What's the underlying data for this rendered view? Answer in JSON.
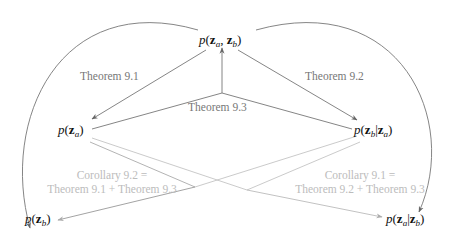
{
  "diagram": {
    "nodes": {
      "joint": {
        "func": "p",
        "parts": [
          "z",
          "a",
          ", ",
          "z",
          "b"
        ],
        "text": "p(z_a, z_b)"
      },
      "marginal_a": {
        "func": "p",
        "text": "p(z_a)"
      },
      "conditional_b_given_a": {
        "func": "p",
        "text": "p(z_b|z_a)"
      },
      "marginal_b": {
        "func": "p",
        "text": "p(z_b)"
      },
      "conditional_a_given_b": {
        "func": "p",
        "text": "p(z_a|z_b)"
      }
    },
    "edge_labels": {
      "theorem_9_1": "Theorem 9.1",
      "theorem_9_2": "Theorem 9.2",
      "theorem_9_3": "Theorem 9.3",
      "corollary_9_2_line1": "Corollary 9.2 =",
      "corollary_9_2_line2": "Theorem 9.1 + Theorem 9.3",
      "corollary_9_1_line1": "Corollary 9.1 =",
      "corollary_9_1_line2": "Theorem 9.2 + Theorem 9.3"
    },
    "symbols": {
      "p": "p",
      "z": "z",
      "a": "a",
      "b": "b",
      "open": "(",
      "close": ")",
      "comma": ", ",
      "bar": "|"
    },
    "colors": {
      "dark_edge": "#777777",
      "light_edge": "#c4c4c4",
      "node_text": "#111111",
      "dark_label": "#777777",
      "light_label": "#bcbcbc"
    }
  }
}
